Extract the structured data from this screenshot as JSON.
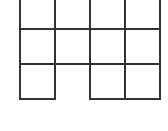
{
  "diagram": {
    "type": "grid-net",
    "line_color": "#333333",
    "background": "#ffffff",
    "cell_size_px": 35,
    "origin": {
      "x": 20,
      "y": -6
    },
    "columns": 4,
    "rows": 3,
    "cells": [
      {
        "row": 0,
        "col": 0
      },
      {
        "row": 0,
        "col": 1
      },
      {
        "row": 0,
        "col": 2
      },
      {
        "row": 0,
        "col": 3
      },
      {
        "row": 1,
        "col": 0
      },
      {
        "row": 1,
        "col": 1
      },
      {
        "row": 1,
        "col": 2
      },
      {
        "row": 1,
        "col": 3
      },
      {
        "row": 2,
        "col": 0
      },
      {
        "row": 2,
        "col": 2
      },
      {
        "row": 2,
        "col": 3
      }
    ],
    "missing_cells": [
      {
        "row": 2,
        "col": 1
      }
    ]
  }
}
